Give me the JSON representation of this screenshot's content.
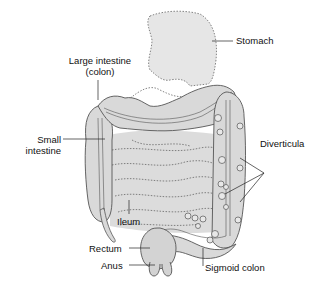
{
  "diagram": {
    "labels": {
      "stomach": "Stomach",
      "large_intestine_line1": "Large intestine",
      "large_intestine_line2": "(colon)",
      "small_intestine_line1": "Small",
      "small_intestine_line2": "intestine",
      "diverticula": "Diverticula",
      "ileum": "Ileum",
      "rectum": "Rectum",
      "anus": "Anus",
      "sigmoid_colon": "Sigmoid colon"
    },
    "colors": {
      "organ_fill": "#d9d9d9",
      "organ_fill_light": "#e6e6e6",
      "outline": "#555555",
      "dotted_outline": "#666666",
      "leader_line": "#222222",
      "background": "#ffffff"
    }
  }
}
